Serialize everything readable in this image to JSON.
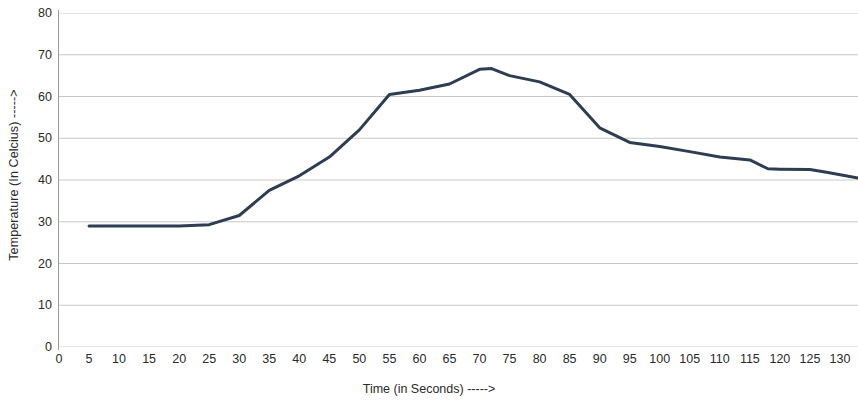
{
  "chart_data": {
    "type": "line",
    "title": "",
    "subtitle": "",
    "xlabel": "Time (in Seconds) ----->",
    "ylabel": "Temperature (In Celcius) ----->",
    "xlim": [
      0,
      133
    ],
    "ylim": [
      0,
      80
    ],
    "grid": true,
    "grid_axis": "y",
    "legend": false,
    "legend_position": "none",
    "xticks": [
      0,
      5,
      10,
      15,
      20,
      25,
      30,
      35,
      40,
      45,
      50,
      55,
      60,
      65,
      70,
      75,
      80,
      85,
      90,
      95,
      100,
      105,
      110,
      115,
      120,
      125,
      130
    ],
    "yticks": [
      0,
      10,
      20,
      30,
      40,
      50,
      60,
      70,
      80
    ],
    "series": [
      {
        "name": "Temperature",
        "color": "#2E3D52",
        "line_width": 3,
        "x": [
          5,
          10,
          15,
          20,
          25,
          30,
          35,
          40,
          45,
          50,
          55,
          60,
          65,
          70,
          72,
          75,
          80,
          85,
          90,
          95,
          100,
          105,
          110,
          115,
          118,
          120,
          125,
          128,
          133
        ],
        "values": [
          29,
          29,
          29,
          29,
          29.3,
          31.5,
          37.5,
          41,
          45.5,
          52,
          60.5,
          61.5,
          63,
          66.5,
          66.7,
          65,
          63.5,
          60.5,
          52.5,
          49,
          48,
          46.8,
          45.5,
          44.8,
          42.7,
          42.6,
          42.5,
          41.8,
          40.5
        ]
      }
    ]
  }
}
